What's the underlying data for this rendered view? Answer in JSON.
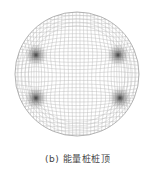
{
  "figure": {
    "caption": "(b) 能量桩桩顶",
    "mesh": {
      "center": [
        77,
        74
      ],
      "radius": 62,
      "line_color": "#b8b8b8",
      "border_color": "#a0a0a0",
      "dense_points": [
        [
          36,
          55
        ],
        [
          118,
          55
        ],
        [
          36,
          98
        ],
        [
          120,
          98
        ]
      ],
      "dense_color": "#333333"
    }
  }
}
